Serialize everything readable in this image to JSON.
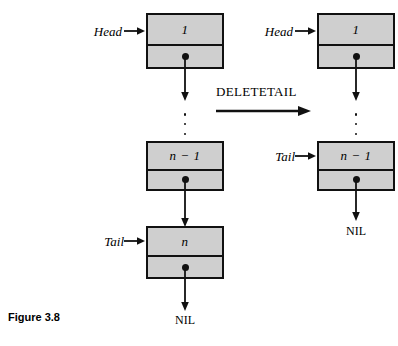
{
  "figure": {
    "caption": "Figure 3.8",
    "operation_label": "DELETETAIL",
    "nil_label": "NIL",
    "colors": {
      "node_fill": "#cfcfcf",
      "stroke": "#111111",
      "background": "#ffffff"
    }
  },
  "before": {
    "pointers": {
      "head_label": "Head",
      "tail_label": "Tail"
    },
    "nodes": [
      {
        "value": "1"
      },
      {
        "value": "n − 1"
      },
      {
        "value": "n"
      }
    ],
    "ellipsis": "⋮",
    "terminator": "NIL"
  },
  "after": {
    "pointers": {
      "head_label": "Head",
      "tail_label": "Tail"
    },
    "nodes": [
      {
        "value": "1"
      },
      {
        "value": "n − 1"
      }
    ],
    "ellipsis": "⋮",
    "terminator": "NIL"
  }
}
